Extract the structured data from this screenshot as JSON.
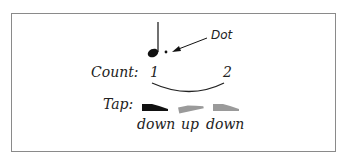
{
  "diagram": {
    "annotation": "Dot",
    "count_label": "Count:",
    "counts": [
      "1",
      "2"
    ],
    "tap_label": "Tap:",
    "taps": [
      {
        "label": "down",
        "state": "active",
        "color": "#111111"
      },
      {
        "label": "up",
        "state": "inactive",
        "color": "#9a9a9a"
      },
      {
        "label": "down",
        "state": "inactive",
        "color": "#9a9a9a"
      }
    ],
    "note": "dotted quarter note"
  }
}
